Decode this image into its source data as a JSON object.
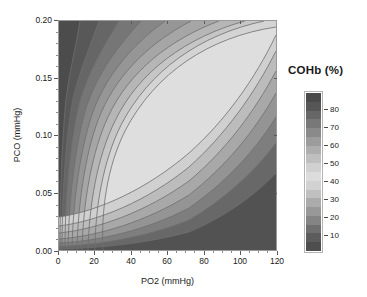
{
  "figure": {
    "kind": "contour-plot",
    "background": "#ffffff"
  },
  "axes": {
    "x": {
      "title": "PO2 (mmHg)",
      "ticks": [
        "0",
        "20",
        "40",
        "60",
        "80",
        "100",
        "120"
      ],
      "range": [
        0,
        120
      ],
      "minor_step": 5
    },
    "y": {
      "title": "PCO (mmHg)",
      "ticks": [
        "0.00",
        "0.05",
        "0.10",
        "0.15",
        "0.20"
      ],
      "range": [
        0.0,
        0.2
      ],
      "minor_step": 0.01
    }
  },
  "legend": {
    "title": "COHb (%)",
    "ticks": [
      "80",
      "70",
      "60",
      "50",
      "40",
      "30",
      "20",
      "10"
    ],
    "tick_values": [
      80,
      70,
      60,
      50,
      40,
      30,
      20,
      10
    ]
  },
  "chart_data": {
    "type": "heatmap",
    "title": "",
    "subtitle": "",
    "xlabel": "PO2 (mmHg)",
    "ylabel": "PCO (mmHg)",
    "zlabel": "COHb (%)",
    "xlim": [
      0,
      120
    ],
    "ylim": [
      0.0,
      0.2
    ],
    "zlim": [
      0,
      90
    ],
    "grid": false,
    "legend_position": "right",
    "colormap": "gray-nonmonotonic",
    "contour_interval": 5,
    "contour_levels": [
      5,
      10,
      15,
      20,
      25,
      30,
      35,
      40,
      45,
      50,
      55,
      60,
      65,
      70,
      75,
      80,
      85
    ],
    "band_fills": [
      {
        "level_range": [
          85,
          90
        ],
        "color": "#4c4c4c"
      },
      {
        "level_range": [
          80,
          85
        ],
        "color": "#585858"
      },
      {
        "level_range": [
          75,
          80
        ],
        "color": "#666666"
      },
      {
        "level_range": [
          70,
          75
        ],
        "color": "#767676"
      },
      {
        "level_range": [
          65,
          70
        ],
        "color": "#868686"
      },
      {
        "level_range": [
          60,
          65
        ],
        "color": "#969696"
      },
      {
        "level_range": [
          55,
          60
        ],
        "color": "#a6a6a6"
      },
      {
        "level_range": [
          50,
          55
        ],
        "color": "#b6b6b6"
      },
      {
        "level_range": [
          45,
          50
        ],
        "color": "#c6c6c6"
      },
      {
        "level_range": [
          40,
          45
        ],
        "color": "#d4d4d4"
      },
      {
        "level_range": [
          35,
          40
        ],
        "color": "#dedede"
      },
      {
        "level_range": [
          30,
          35
        ],
        "color": "#d0d0d0"
      },
      {
        "level_range": [
          25,
          30
        ],
        "color": "#bcbcbc"
      },
      {
        "level_range": [
          20,
          25
        ],
        "color": "#a8a8a8"
      },
      {
        "level_range": [
          15,
          20
        ],
        "color": "#949494"
      },
      {
        "level_range": [
          10,
          15
        ],
        "color": "#7e7e7e"
      },
      {
        "level_range": [
          5,
          10
        ],
        "color": "#686868"
      },
      {
        "level_range": [
          0,
          5
        ],
        "color": "#525252"
      }
    ],
    "colorbar_bands": [
      {
        "color": "#4a4a4a"
      },
      {
        "color": "#565656"
      },
      {
        "color": "#676767"
      },
      {
        "color": "#787878"
      },
      {
        "color": "#8a8a8a"
      },
      {
        "color": "#9c9c9c"
      },
      {
        "color": "#aeaeae"
      },
      {
        "color": "#bfbfbf"
      },
      {
        "color": "#d0d0d0"
      },
      {
        "color": "#dcdcdc"
      },
      {
        "color": "#d2d2d2"
      },
      {
        "color": "#c0c0c0"
      },
      {
        "color": "#ababab"
      },
      {
        "color": "#989898"
      },
      {
        "color": "#848484"
      },
      {
        "color": "#6f6f6f"
      },
      {
        "color": "#5c5c5c"
      },
      {
        "color": "#4e4e4e"
      }
    ],
    "sampled_points": [
      {
        "PO2": 0,
        "PCO": 0.2,
        "COHb": 82
      },
      {
        "PO2": 0,
        "PCO": 0.15,
        "COHb": 78
      },
      {
        "PO2": 0,
        "PCO": 0.1,
        "COHb": 60
      },
      {
        "PO2": 0,
        "PCO": 0.05,
        "COHb": 30
      },
      {
        "PO2": 0,
        "PCO": 0.0,
        "COHb": 2
      },
      {
        "PO2": 20,
        "PCO": 0.2,
        "COHb": 62
      },
      {
        "PO2": 20,
        "PCO": 0.1,
        "COHb": 42
      },
      {
        "PO2": 20,
        "PCO": 0.05,
        "COHb": 22
      },
      {
        "PO2": 20,
        "PCO": 0.0,
        "COHb": 2
      },
      {
        "PO2": 60,
        "PCO": 0.2,
        "COHb": 42
      },
      {
        "PO2": 60,
        "PCO": 0.1,
        "COHb": 26
      },
      {
        "PO2": 60,
        "PCO": 0.05,
        "COHb": 14
      },
      {
        "PO2": 60,
        "PCO": 0.0,
        "COHb": 2
      },
      {
        "PO2": 120,
        "PCO": 0.2,
        "COHb": 30
      },
      {
        "PO2": 120,
        "PCO": 0.1,
        "COHb": 17
      },
      {
        "PO2": 120,
        "PCO": 0.05,
        "COHb": 9
      },
      {
        "PO2": 120,
        "PCO": 0.0,
        "COHb": 1
      }
    ]
  }
}
